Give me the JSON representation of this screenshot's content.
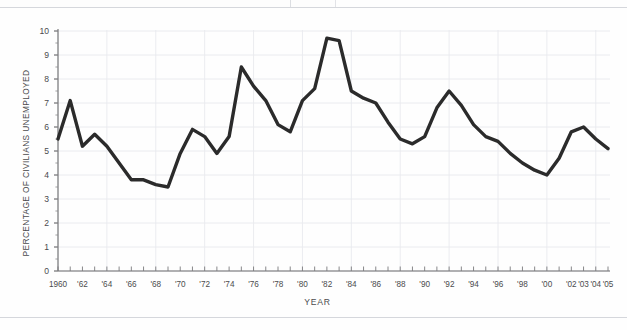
{
  "page": {
    "background_color": "#fefefe",
    "rule_color": "#d5d7dc"
  },
  "chart_data": {
    "type": "line",
    "title": "",
    "subtitle": "",
    "xlabel": "YEAR",
    "ylabel": "PERCENTAGE OF CIVILIANS UNEMPLOYED",
    "xlim": [
      1960,
      2005
    ],
    "ylim": [
      0,
      10
    ],
    "yticks": [
      0,
      1,
      2,
      3,
      4,
      5,
      6,
      7,
      8,
      9,
      10
    ],
    "ytick_labels": [
      "0",
      "1",
      "2",
      "3",
      "4",
      "5",
      "6",
      "7",
      "8",
      "9",
      "10"
    ],
    "grid": true,
    "grid_color": "#e9eaee",
    "legend": "none",
    "line_color": "#2b2b2b",
    "line_width": 3.4,
    "xtick_years": [
      1960,
      1961,
      1962,
      1963,
      1964,
      1965,
      1966,
      1967,
      1968,
      1969,
      1970,
      1971,
      1972,
      1973,
      1974,
      1975,
      1976,
      1977,
      1978,
      1979,
      1980,
      1981,
      1982,
      1983,
      1984,
      1985,
      1986,
      1987,
      1988,
      1989,
      1990,
      1991,
      1992,
      1993,
      1994,
      1995,
      1996,
      1997,
      1998,
      1999,
      2000,
      2001,
      2002,
      2003,
      2004,
      2005
    ],
    "xtick_labels": [
      {
        "year": 1960,
        "label": "1960"
      },
      {
        "year": 1962,
        "label": "'62"
      },
      {
        "year": 1964,
        "label": "'64"
      },
      {
        "year": 1966,
        "label": "'66"
      },
      {
        "year": 1968,
        "label": "'68"
      },
      {
        "year": 1970,
        "label": "'70"
      },
      {
        "year": 1972,
        "label": "'72"
      },
      {
        "year": 1974,
        "label": "'74"
      },
      {
        "year": 1976,
        "label": "'76"
      },
      {
        "year": 1978,
        "label": "'78"
      },
      {
        "year": 1980,
        "label": "'80"
      },
      {
        "year": 1982,
        "label": "'82"
      },
      {
        "year": 1984,
        "label": "'84"
      },
      {
        "year": 1986,
        "label": "'86"
      },
      {
        "year": 1988,
        "label": "'88"
      },
      {
        "year": 1990,
        "label": "'90"
      },
      {
        "year": 1992,
        "label": "'92"
      },
      {
        "year": 1994,
        "label": "'94"
      },
      {
        "year": 1996,
        "label": "'96"
      },
      {
        "year": 1998,
        "label": "'98"
      },
      {
        "year": 2000,
        "label": "'00"
      },
      {
        "year": 2002,
        "label": "'02"
      },
      {
        "year": 2003,
        "label": "'03"
      },
      {
        "year": 2004,
        "label": "'04"
      },
      {
        "year": 2005,
        "label": "'05"
      }
    ],
    "x": [
      1960,
      1961,
      1962,
      1963,
      1964,
      1965,
      1966,
      1967,
      1968,
      1969,
      1970,
      1971,
      1972,
      1973,
      1974,
      1975,
      1976,
      1977,
      1978,
      1979,
      1980,
      1981,
      1982,
      1983,
      1984,
      1985,
      1986,
      1987,
      1988,
      1989,
      1990,
      1991,
      1992,
      1993,
      1994,
      1995,
      1996,
      1997,
      1998,
      1999,
      2000,
      2001,
      2002,
      2003,
      2004,
      2005
    ],
    "values": [
      5.5,
      7.1,
      5.2,
      5.7,
      5.2,
      4.5,
      3.8,
      3.8,
      3.6,
      3.5,
      4.9,
      5.9,
      5.6,
      4.9,
      5.6,
      8.5,
      7.7,
      7.1,
      6.1,
      5.8,
      7.1,
      7.6,
      9.7,
      9.6,
      7.5,
      7.2,
      7.0,
      6.2,
      5.5,
      5.3,
      5.6,
      6.8,
      7.5,
      6.9,
      6.1,
      5.6,
      5.4,
      4.9,
      4.5,
      4.2,
      4.0,
      4.7,
      5.8,
      6.0,
      5.5,
      5.1
    ]
  }
}
